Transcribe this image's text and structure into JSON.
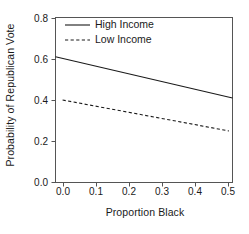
{
  "chart_data": {
    "type": "line",
    "title": "",
    "xlabel": "Proportion Black",
    "ylabel": "Probability of Republican Vote",
    "xlim": [
      0.0,
      0.5
    ],
    "ylim": [
      0.0,
      0.8
    ],
    "xticks": [
      "0.0",
      "0.1",
      "0.2",
      "0.3",
      "0.4",
      "0.5"
    ],
    "xtick_values": [
      0.0,
      0.1,
      0.2,
      0.3,
      0.4,
      0.5
    ],
    "yticks": [
      "0.0",
      "0.2",
      "0.4",
      "0.6",
      "0.8"
    ],
    "ytick_values": [
      0.0,
      0.2,
      0.4,
      0.6,
      0.8
    ],
    "grid": false,
    "legend_position": "top-left-inside",
    "series": [
      {
        "name": "High Income",
        "style": "solid",
        "color": "#1a1a1a",
        "x": [
          0.0,
          0.5
        ],
        "values": [
          0.61,
          0.41
        ]
      },
      {
        "name": "Low Income",
        "style": "dashed",
        "color": "#1a1a1a",
        "x": [
          0.02,
          0.49
        ],
        "values": [
          0.4,
          0.25
        ]
      }
    ]
  },
  "legend": {
    "entries": [
      {
        "label": "High Income"
      },
      {
        "label": "Low Income"
      }
    ]
  },
  "axes": {
    "x_title": "Proportion Black",
    "y_title": "Probability of Republican Vote",
    "x_tick_labels": [
      "0.0",
      "0.1",
      "0.2",
      "0.3",
      "0.4",
      "0.5"
    ],
    "y_tick_labels": [
      "0.0",
      "0.2",
      "0.4",
      "0.6",
      "0.8"
    ]
  },
  "colors": {
    "background": "#ffffff",
    "ink": "#1a1a1a",
    "axis": "#555555"
  }
}
